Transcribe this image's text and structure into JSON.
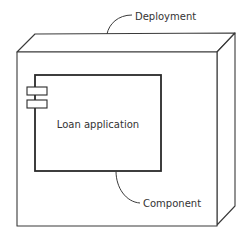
{
  "diagram": {
    "type": "UML deployment diagram",
    "node": {
      "label": "Deployment"
    },
    "component": {
      "label": "Loan application"
    },
    "annotations": {
      "deployment": "Deployment",
      "component": "Component"
    },
    "colors": {
      "stroke": "#3a3a3a",
      "background": "#ffffff",
      "text": "#333333"
    }
  }
}
